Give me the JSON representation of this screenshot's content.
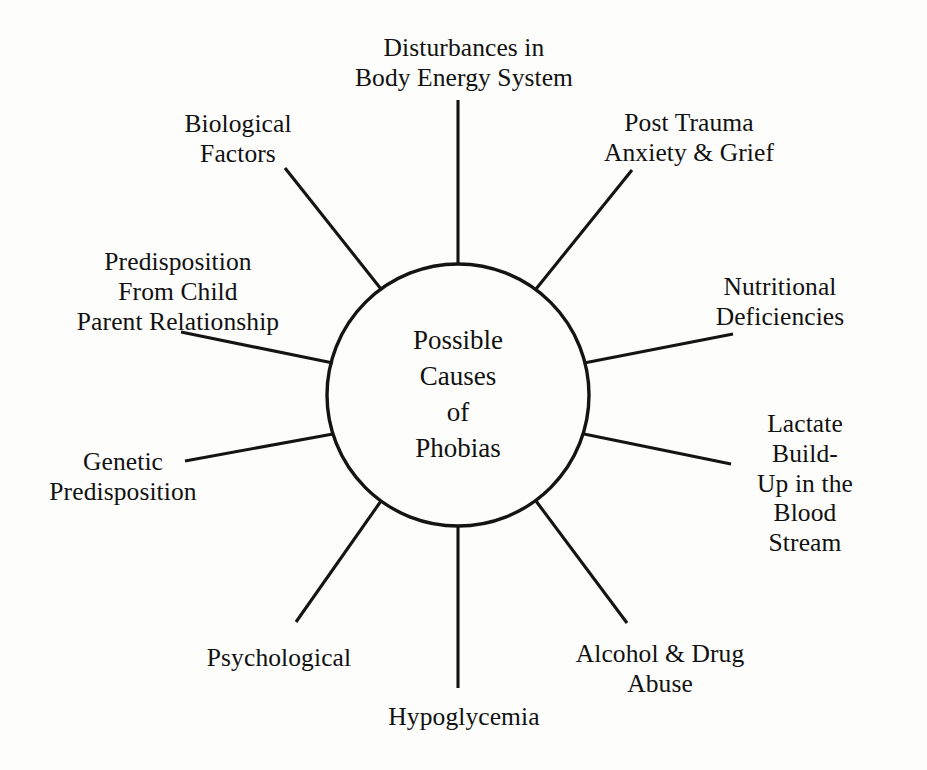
{
  "diagram": {
    "type": "radial-spoke-diagram",
    "title": "Possible Causes of Phobias",
    "background_color": "#fdfdfb",
    "line_color": "#141414",
    "text_color": "#111111",
    "hub": {
      "label": "Possible\nCauses\nof\nPhobias",
      "center_x": 458,
      "center_y": 395,
      "radius": 131
    },
    "nodes": [
      {
        "id": "disturbances-body-energy-system",
        "label": "Disturbances in\nBody Energy System",
        "angle_deg": 90,
        "label_x": 464,
        "label_y": 63,
        "spoke_inner_x": 458,
        "spoke_inner_y": 264,
        "spoke_outer_x": 458,
        "spoke_outer_y": 100
      },
      {
        "id": "biological-factors",
        "label": "Biological\nFactors",
        "angle_deg": 126,
        "label_x": 238,
        "label_y": 139,
        "spoke_inner_x": 381,
        "spoke_inner_y": 289,
        "spoke_outer_x": 285,
        "spoke_outer_y": 168
      },
      {
        "id": "predisposition-from-child-parent-relationship",
        "label": "Predisposition\nFrom Child\nParent Relationship",
        "angle_deg": 162,
        "label_x": 178,
        "label_y": 292,
        "spoke_inner_x": 333,
        "spoke_inner_y": 363,
        "spoke_outer_x": 181,
        "spoke_outer_y": 332
      },
      {
        "id": "genetic-predisposition",
        "label": "Genetic\nPredisposition",
        "angle_deg": 198,
        "label_x": 123,
        "label_y": 477,
        "spoke_inner_x": 333,
        "spoke_inner_y": 434,
        "spoke_outer_x": 185,
        "spoke_outer_y": 461
      },
      {
        "id": "psychological",
        "label": "Psychological",
        "angle_deg": 234,
        "label_x": 279,
        "label_y": 658,
        "spoke_inner_x": 381,
        "spoke_inner_y": 501,
        "spoke_outer_x": 296,
        "spoke_outer_y": 622
      },
      {
        "id": "hypoglycemia",
        "label": "Hypoglycemia",
        "angle_deg": 270,
        "label_x": 464,
        "label_y": 717,
        "spoke_inner_x": 458,
        "spoke_inner_y": 527,
        "spoke_outer_x": 458,
        "spoke_outer_y": 688
      },
      {
        "id": "alcohol-drug-abuse",
        "label": "Alcohol & Drug\nAbuse",
        "angle_deg": 306,
        "label_x": 660,
        "label_y": 669,
        "spoke_inner_x": 536,
        "spoke_inner_y": 501,
        "spoke_outer_x": 627,
        "spoke_outer_y": 623
      },
      {
        "id": "lactate-build-up-blood-stream",
        "label": "Lactate Build-\nUp in the\nBlood Stream",
        "angle_deg": 342,
        "label_x": 805,
        "label_y": 484,
        "spoke_inner_x": 584,
        "spoke_inner_y": 434,
        "spoke_outer_x": 731,
        "spoke_outer_y": 464
      },
      {
        "id": "nutritional-deficiencies",
        "label": "Nutritional\nDeficiencies",
        "angle_deg": 18,
        "label_x": 780,
        "label_y": 302,
        "spoke_inner_x": 584,
        "spoke_inner_y": 363,
        "spoke_outer_x": 733,
        "spoke_outer_y": 334
      },
      {
        "id": "post-trauma-anxiety-grief",
        "label": "Post Trauma\nAnxiety & Grief",
        "angle_deg": 54,
        "label_x": 689,
        "label_y": 138,
        "spoke_inner_x": 536,
        "spoke_inner_y": 289,
        "spoke_outer_x": 632,
        "spoke_outer_y": 170
      }
    ]
  }
}
